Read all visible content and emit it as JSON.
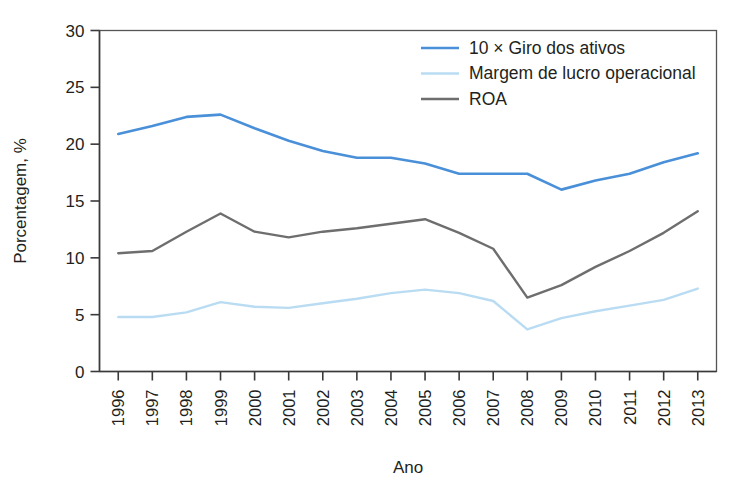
{
  "chart_data": {
    "type": "line",
    "title": "",
    "xlabel": "Ano",
    "ylabel": "Porcentagem, %",
    "categories": [
      "1996",
      "1997",
      "1998",
      "1999",
      "2000",
      "2001",
      "2002",
      "2003",
      "2004",
      "2005",
      "2006",
      "2007",
      "2008",
      "2009",
      "2010",
      "2011",
      "2012",
      "2013"
    ],
    "xtick_labels": [
      "1996",
      "1997",
      "1998",
      "1999",
      "2000",
      "2001",
      "2002",
      "2003",
      "2004",
      "2005",
      "2006",
      "2007",
      "2008",
      "2009",
      "2010",
      "2011",
      "2012",
      "2013"
    ],
    "ytick_labels": [
      "0",
      "5",
      "10",
      "15",
      "20",
      "25",
      "30"
    ],
    "yticks": [
      0,
      5,
      10,
      15,
      20,
      25,
      30
    ],
    "ylim": [
      0,
      30
    ],
    "grid": false,
    "legend_position": "top-right",
    "series": [
      {
        "name": "10 × Giro dos ativos",
        "color": "#4a90d9",
        "width": 2.6,
        "values": [
          20.9,
          21.6,
          22.4,
          22.6,
          21.4,
          20.3,
          19.4,
          18.8,
          18.8,
          18.3,
          17.4,
          17.4,
          17.4,
          16.0,
          16.8,
          17.4,
          18.4,
          19.2
        ]
      },
      {
        "name": "Margem de lucro operacional",
        "color": "#b9dcf2",
        "width": 2.4,
        "values": [
          4.8,
          4.8,
          5.2,
          6.1,
          5.7,
          5.6,
          6.0,
          6.4,
          6.9,
          7.2,
          6.9,
          6.2,
          3.7,
          4.7,
          5.3,
          5.8,
          6.3,
          7.3
        ]
      },
      {
        "name": "ROA",
        "color": "#6e6e6e",
        "width": 2.4,
        "values": [
          10.4,
          10.6,
          12.3,
          13.9,
          12.3,
          11.8,
          12.3,
          12.6,
          13.0,
          13.4,
          12.2,
          10.8,
          6.5,
          7.6,
          9.2,
          10.6,
          12.2,
          14.1
        ]
      }
    ]
  },
  "legend": {
    "items": [
      {
        "label": "10 × Giro dos ativos",
        "color": "#4a90d9"
      },
      {
        "label": "Margem de lucro operacional",
        "color": "#b9dcf2"
      },
      {
        "label": "ROA",
        "color": "#6e6e6e"
      }
    ]
  },
  "axes": {
    "y_title": "Porcentagem, %",
    "x_title": "Ano"
  }
}
